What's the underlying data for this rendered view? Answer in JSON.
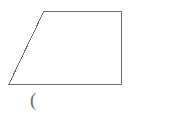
{
  "canvas": {
    "width": 190,
    "height": 121,
    "background_color": "#ffffff"
  },
  "figure": {
    "name": "trapezoid",
    "type": "quadrilateral",
    "stroke_color": "#6e6e6e",
    "stroke_width": 1,
    "fill": "none",
    "points": "44,11 121,11 121,84 9,84",
    "vertices": [
      {
        "label": "top-left",
        "x": 44,
        "y": 11
      },
      {
        "label": "top-right",
        "x": 121,
        "y": 11
      },
      {
        "label": "bottom-right",
        "x": 121,
        "y": 84
      },
      {
        "label": "bottom-left",
        "x": 9,
        "y": 84
      }
    ],
    "edges": [
      {
        "name": "top-edge",
        "from": "top-left",
        "to": "top-right"
      },
      {
        "name": "right-edge",
        "from": "top-right",
        "to": "bottom-right"
      },
      {
        "name": "bottom-edge",
        "from": "bottom-right",
        "to": "bottom-left"
      },
      {
        "name": "left-slant-edge",
        "from": "bottom-left",
        "to": "top-left"
      }
    ]
  },
  "caption": {
    "text": "(",
    "color": "#6b6b6b"
  }
}
